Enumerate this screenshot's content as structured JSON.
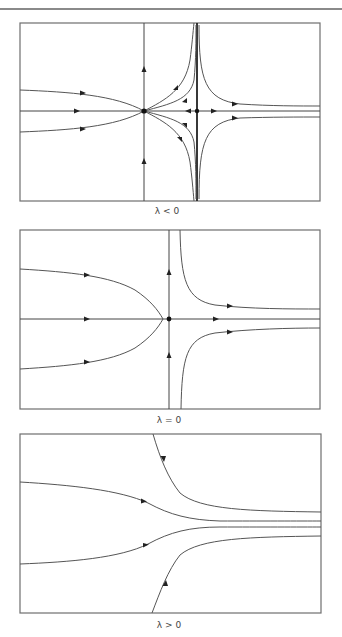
{
  "figure": {
    "panels": [
      {
        "id": "lambda-negative",
        "caption": "λ < 0",
        "description": "Phase portrait with a stable node and a saddle; vertical separatrix through the saddle"
      },
      {
        "id": "lambda-zero",
        "caption": "λ = 0",
        "description": "Saddle-node bifurcation point: node and saddle coalesce into a cusp-shaped equilibrium"
      },
      {
        "id": "lambda-positive",
        "caption": "λ > 0",
        "description": "No equilibria; all trajectories flow left to right and converge"
      }
    ]
  },
  "colors": {
    "frame": "#6e6e6e",
    "trajectory": "#555555",
    "arrow": "#222222",
    "background": "#ffffff"
  }
}
